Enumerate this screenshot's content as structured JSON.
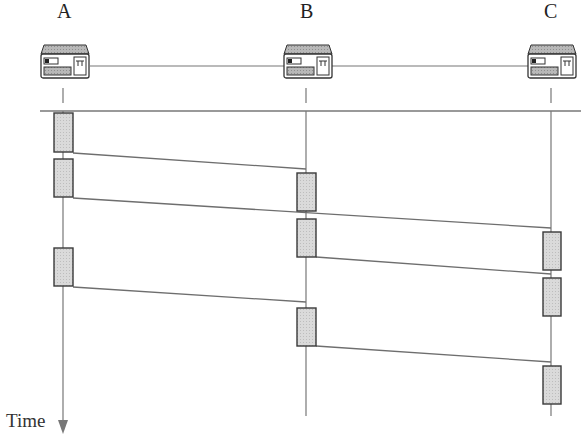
{
  "diagram": {
    "type": "message-sequence timing diagram",
    "nodes": [
      {
        "id": "A",
        "label": "A",
        "x": 63
      },
      {
        "id": "B",
        "label": "B",
        "x": 306
      },
      {
        "id": "C",
        "label": "C",
        "x": 551
      }
    ],
    "time_axis_label": "Time",
    "network_line_y": 111,
    "transmission_boxes": [
      {
        "node": "A",
        "y1": 113,
        "y2": 152
      },
      {
        "node": "A",
        "y1": 159,
        "y2": 197
      },
      {
        "node": "A",
        "y1": 248,
        "y2": 286
      },
      {
        "node": "B",
        "y1": 173,
        "y2": 211
      },
      {
        "node": "B",
        "y1": 219,
        "y2": 257
      },
      {
        "node": "B",
        "y1": 308,
        "y2": 346
      },
      {
        "node": "C",
        "y1": 232,
        "y2": 270
      },
      {
        "node": "C",
        "y1": 278,
        "y2": 316
      },
      {
        "node": "C",
        "y1": 366,
        "y2": 404
      }
    ],
    "messages": [
      {
        "from": "A",
        "to": "B",
        "y_start": 153,
        "y_end": 169
      },
      {
        "from": "A",
        "to": "C",
        "y_start": 198,
        "y_end": 228
      },
      {
        "from": "B",
        "to": "C",
        "y_start": 257,
        "y_end": 274
      },
      {
        "from": "A",
        "to": "B",
        "y_start": 287,
        "y_end": 302
      },
      {
        "from": "B",
        "to": "C",
        "y_start": 346,
        "y_end": 362
      }
    ],
    "colors": {
      "line": "#6e6e6e",
      "box_fill": "#d6d6d6",
      "box_stroke": "#3a3a3a"
    }
  }
}
